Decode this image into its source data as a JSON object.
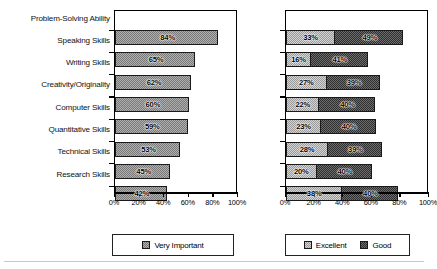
{
  "chart_data": [
    {
      "type": "bar",
      "orientation": "horizontal",
      "title": "",
      "xlabel": "",
      "ylabel": "",
      "xlim": [
        0,
        100
      ],
      "xticks": [
        0,
        20,
        40,
        60,
        80,
        100
      ],
      "xticklabels": [
        "0%",
        "20%",
        "40%",
        "60%",
        "80%",
        "100%"
      ],
      "grid": false,
      "legend_position": "bottom",
      "categories": [
        "Problem-Solving Ability",
        "Speaking Skills",
        "Writing Skills",
        "Creativity/Originality",
        "Computer Skills",
        "Quantitative Skills",
        "Technical Skills",
        "Research Skills"
      ],
      "series": [
        {
          "name": "Very Important",
          "values": [
            84,
            65,
            62,
            60,
            59,
            53,
            45,
            42
          ],
          "labels": [
            "84%",
            "65%",
            "62%",
            "60%",
            "59%",
            "53%",
            "45%",
            "42%"
          ],
          "fill": "fill-mid"
        }
      ]
    },
    {
      "type": "bar",
      "orientation": "horizontal",
      "stacked": true,
      "title": "",
      "xlabel": "",
      "ylabel": "",
      "xlim": [
        0,
        100
      ],
      "xticks": [
        0,
        20,
        40,
        60,
        80,
        100
      ],
      "xticklabels": [
        "0%",
        "20%",
        "40%",
        "60%",
        "80%",
        "100%"
      ],
      "grid": false,
      "legend_position": "bottom",
      "categories": [
        "Problem-Solving Ability",
        "Speaking Skills",
        "Writing Skills",
        "Creativity/Originality",
        "Computer Skills",
        "Quantitative Skills",
        "Technical Skills",
        "Research Skills"
      ],
      "series": [
        {
          "name": "Excellent",
          "values": [
            33,
            16,
            27,
            22,
            23,
            28,
            20,
            38
          ],
          "labels": [
            "33%",
            "16%",
            "27%",
            "22%",
            "23%",
            "28%",
            "20%",
            "38%"
          ],
          "fill": "fill-light"
        },
        {
          "name": "Good",
          "values": [
            49,
            41,
            39,
            40,
            40,
            39,
            40,
            40
          ],
          "labels": [
            "49%",
            "41%",
            "39%",
            "40%",
            "40%",
            "39%",
            "40%",
            "40%"
          ],
          "fill": "fill-dark"
        }
      ]
    }
  ],
  "left_chart": {
    "legend": {
      "items": [
        {
          "label": "Very Important",
          "swatch": "fill-mid"
        }
      ]
    }
  },
  "right_chart": {
    "legend": {
      "items": [
        {
          "label": "Excellent",
          "swatch": "fill-light"
        },
        {
          "label": "Good",
          "swatch": "fill-dark"
        }
      ]
    }
  }
}
